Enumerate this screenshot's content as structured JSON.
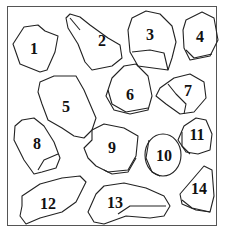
{
  "figure": {
    "border_color": "#555555",
    "stroke_color": "#222222",
    "shapes": [
      {
        "id": 1,
        "label": "1"
      },
      {
        "id": 2,
        "label": "2"
      },
      {
        "id": 3,
        "label": "3"
      },
      {
        "id": 4,
        "label": "4"
      },
      {
        "id": 5,
        "label": "5"
      },
      {
        "id": 6,
        "label": "6"
      },
      {
        "id": 7,
        "label": "7"
      },
      {
        "id": 8,
        "label": "8"
      },
      {
        "id": 9,
        "label": "9"
      },
      {
        "id": 10,
        "label": "10"
      },
      {
        "id": 11,
        "label": "11"
      },
      {
        "id": 12,
        "label": "12"
      },
      {
        "id": 13,
        "label": "13"
      },
      {
        "id": 14,
        "label": "14"
      }
    ]
  }
}
